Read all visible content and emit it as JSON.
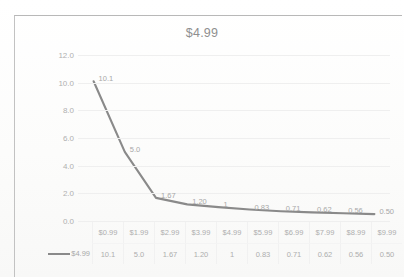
{
  "chart_data": {
    "type": "line",
    "title": "$4.99",
    "xlabel": "",
    "ylabel": "",
    "categories": [
      "$0.99",
      "$1.99",
      "$2.99",
      "$3.99",
      "$4.99",
      "$5.99",
      "$6.99",
      "$7.99",
      "$8.99",
      "$9.99"
    ],
    "series": [
      {
        "name": "$4.99",
        "values": [
          10.1,
          5.0,
          1.67,
          1.2,
          1,
          0.83,
          0.71,
          0.62,
          0.56,
          0.5
        ],
        "value_labels": [
          "10.1",
          "5.0",
          "1.67",
          "1.20",
          "1",
          "0.83",
          "0.71",
          "0.62",
          "0.56",
          "0.50"
        ],
        "color": "#8a8a8a"
      }
    ],
    "ylim": [
      0,
      12
    ],
    "ytick_labels": [
      "12.0",
      "10.0",
      "8.0",
      "6.0",
      "4.0",
      "2.0",
      "0.0"
    ],
    "yticks": [
      12,
      10,
      8,
      6,
      4,
      2,
      0
    ],
    "grid": true,
    "legend_position": "bottom-table",
    "data_table_visible": true,
    "data_labels_visible": true
  },
  "legend": {
    "series_label": "$4.99"
  },
  "colors": {
    "line": "#8a8a8a",
    "gridline": "#efefef",
    "text": "#a8a8a8",
    "frame": "#b8b8b8",
    "background": "#fdfdfd"
  }
}
